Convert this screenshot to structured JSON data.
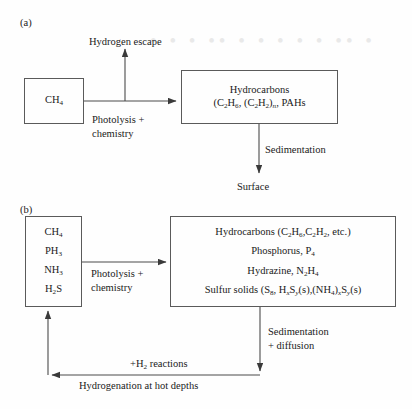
{
  "figure": {
    "panel_a_label": "(a)",
    "panel_b_label": "(b)",
    "watermark_text": "• • •  •• • •  • • •  •• •"
  },
  "panel_a": {
    "source_box": {
      "line1_html": "CH<sub>4</sub>"
    },
    "product_box": {
      "line1": "Hydrocarbons",
      "line2_html": "(C<sub>2</sub>H<sub>6</sub>, (C<sub>2</sub>H<sub>2</sub>)<sub class=\"ital\">n</sub>, PAHs"
    },
    "escape_label": "Hydrogen escape",
    "process_label": "Photolysis +\nchemistry",
    "sedimentation_label": "Sedimentation",
    "sink_label": "Surface"
  },
  "panel_b": {
    "source_box": {
      "species": [
        "CH<sub>4</sub>",
        "PH<sub>3</sub>",
        "NH<sub>3</sub>",
        "H<sub>2</sub>S"
      ]
    },
    "product_box": {
      "lines": [
        "Hydrocarbons (C<sub>2</sub>H<sub>6</sub>,C<sub>2</sub>H<sub>2</sub>, etc.)",
        "Phosphorus, P<sub>4</sub>",
        "Hydrazine, N<sub>2</sub>H<sub>4</sub>",
        "Sulfur solids (S<sub>8</sub>, H<sub><span class=\"ital\">x</span></sub>S<sub><span class=\"ital\">y</span></sub>(s),(NH<sub>4</sub>)<sub><span class=\"ital\">x</span></sub>S<sub><span class=\"ital\">y</span></sub>(s)"
      ]
    },
    "process_label": "Photolysis +\nchemistry",
    "sedimentation_label": "Sedimentation\n+ diffusion",
    "return_label_upper": "+H<sub>2</sub> reactions",
    "return_label_lower": "Hydrogenation at hot depths"
  },
  "colors": {
    "stroke": "#4a4a4a",
    "text": "#1a1a1a",
    "background": "#fefefe"
  }
}
